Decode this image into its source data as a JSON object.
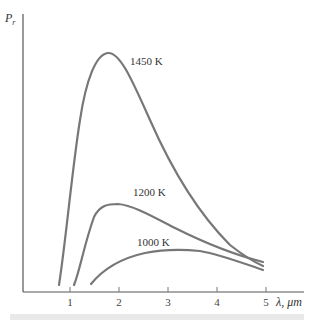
{
  "chart_data": {
    "type": "line",
    "title": "",
    "xlabel": "λ, μm",
    "ylabel": "P_r",
    "xlim": [
      0.05,
      5.75
    ],
    "ylim": [
      0,
      1
    ],
    "x_ticks": [
      1,
      2,
      3,
      4,
      5
    ],
    "x_tick_labels": [
      "1",
      "2",
      "3",
      "4",
      "5"
    ],
    "y_ticks": [],
    "grid": false,
    "legend": "inline labels",
    "series": [
      {
        "name": "1450 K",
        "label": "1450 K",
        "x": [
          0.8,
          1.0,
          1.2,
          1.4,
          1.6,
          1.8,
          2.0,
          2.3,
          2.6,
          3.0,
          3.5,
          4.0,
          4.5,
          4.9
        ],
        "y": [
          0.03,
          0.3,
          0.6,
          0.85,
          0.97,
          1.0,
          0.96,
          0.84,
          0.7,
          0.54,
          0.38,
          0.26,
          0.17,
          0.11
        ]
      },
      {
        "name": "1200 K",
        "label": "1200 K",
        "x": [
          1.1,
          1.3,
          1.5,
          1.7,
          1.9,
          2.1,
          2.4,
          2.8,
          3.2,
          3.6,
          4.0,
          4.5,
          4.9
        ],
        "y": [
          0.03,
          0.14,
          0.25,
          0.31,
          0.33,
          0.33,
          0.31,
          0.27,
          0.22,
          0.18,
          0.14,
          0.1,
          0.08
        ]
      },
      {
        "name": "1000 K",
        "label": "1000 K",
        "x": [
          1.45,
          1.7,
          2.0,
          2.4,
          2.8,
          3.2,
          3.6,
          4.0,
          4.5,
          4.9
        ],
        "y": [
          0.03,
          0.07,
          0.11,
          0.14,
          0.15,
          0.145,
          0.13,
          0.11,
          0.08,
          0.065
        ]
      }
    ]
  },
  "labels": {
    "y_axis": "P",
    "y_axis_sub": "r",
    "x_axis": "λ, μm",
    "curve_1450": "1450 K",
    "curve_1200": "1200 K",
    "curve_1000": "1000 K"
  },
  "colors": {
    "curve": "#777777",
    "axis": "#555555",
    "bar": "#e9e9e9"
  }
}
